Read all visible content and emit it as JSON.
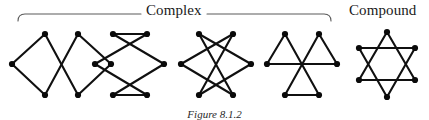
{
  "figure": {
    "caption": "Figure 8.1.2",
    "background_color": "#ffffff",
    "edge_color": "#101010",
    "vertex_color": "#0a0a0a",
    "brace_color": "#5a5a5a",
    "group_labels": {
      "complex": "Complex",
      "compound": "Compound"
    },
    "brace": {
      "name": "complex-group-brace",
      "x_start": 18,
      "x_end": 331,
      "y": 14,
      "gap_start": 141,
      "gap_end": 207
    },
    "panels": [
      {
        "id": "panel-1",
        "name": "complex-hexagram-1",
        "group": "complex",
        "vertex_count": 6,
        "edge_count": 6,
        "description": "two overlapping rhombi sharing crossing edges",
        "vertices": [
          {
            "id": "v0",
            "x": 45,
            "y": 34
          },
          {
            "id": "v1",
            "x": 12,
            "y": 64
          },
          {
            "id": "v2",
            "x": 45,
            "y": 95
          },
          {
            "id": "v3",
            "x": 78,
            "y": 34
          },
          {
            "id": "v4",
            "x": 78,
            "y": 95
          },
          {
            "id": "v5",
            "x": 111,
            "y": 64
          }
        ],
        "edges": [
          [
            "v0",
            "v1"
          ],
          [
            "v1",
            "v2"
          ],
          [
            "v0",
            "v4"
          ],
          [
            "v2",
            "v3"
          ],
          [
            "v3",
            "v5"
          ],
          [
            "v5",
            "v4"
          ]
        ]
      },
      {
        "id": "panel-2",
        "name": "complex-hexagram-2",
        "group": "complex",
        "vertex_count": 6,
        "edge_count": 6,
        "description": "hourglass crossings with flat top and bottom chords",
        "vertices": [
          {
            "id": "v0",
            "x": 113,
            "y": 34
          },
          {
            "id": "v1",
            "x": 95,
            "y": 64
          },
          {
            "id": "v2",
            "x": 113,
            "y": 95
          },
          {
            "id": "v3",
            "x": 147,
            "y": 34
          },
          {
            "id": "v4",
            "x": 147,
            "y": 95
          },
          {
            "id": "v5",
            "x": 164,
            "y": 64
          }
        ],
        "edges": [
          [
            "v0",
            "v3"
          ],
          [
            "v2",
            "v4"
          ],
          [
            "v0",
            "v5"
          ],
          [
            "v1",
            "v3"
          ],
          [
            "v1",
            "v4"
          ],
          [
            "v2",
            "v5"
          ]
        ]
      },
      {
        "id": "panel-3",
        "name": "complex-hexagram-3",
        "group": "complex",
        "vertex_count": 6,
        "edge_count": 6,
        "description": "fully crossed star with no parallel chords",
        "vertices": [
          {
            "id": "v0",
            "x": 199,
            "y": 34
          },
          {
            "id": "v1",
            "x": 181,
            "y": 64
          },
          {
            "id": "v2",
            "x": 199,
            "y": 95
          },
          {
            "id": "v3",
            "x": 233,
            "y": 34
          },
          {
            "id": "v4",
            "x": 233,
            "y": 95
          },
          {
            "id": "v5",
            "x": 251,
            "y": 64
          }
        ],
        "edges": [
          [
            "v0",
            "v4"
          ],
          [
            "v0",
            "v5"
          ],
          [
            "v1",
            "v3"
          ],
          [
            "v1",
            "v4"
          ],
          [
            "v2",
            "v3"
          ],
          [
            "v2",
            "v5"
          ]
        ]
      },
      {
        "id": "panel-4",
        "name": "complex-hexagram-4",
        "group": "complex",
        "vertex_count": 6,
        "edge_count": 6,
        "description": "three triangles meeting at a single central crossing",
        "vertices": [
          {
            "id": "v0",
            "x": 285,
            "y": 34
          },
          {
            "id": "v1",
            "x": 267,
            "y": 64
          },
          {
            "id": "v2",
            "x": 285,
            "y": 95
          },
          {
            "id": "v3",
            "x": 319,
            "y": 34
          },
          {
            "id": "v4",
            "x": 319,
            "y": 95
          },
          {
            "id": "v5",
            "x": 337,
            "y": 64
          }
        ],
        "edges": [
          [
            "v0",
            "v1"
          ],
          [
            "v0",
            "v4"
          ],
          [
            "v1",
            "v5"
          ],
          [
            "v2",
            "v3"
          ],
          [
            "v2",
            "v4"
          ],
          [
            "v3",
            "v5"
          ]
        ]
      },
      {
        "id": "panel-5",
        "name": "compound-hexagram-star-of-david",
        "group": "compound",
        "vertex_count": 6,
        "edge_count": 6,
        "description": "regular hexagram formed by two overlaid equilateral triangles",
        "vertices": [
          {
            "id": "v0",
            "x": 387,
            "y": 32
          },
          {
            "id": "v1",
            "x": 359,
            "y": 48
          },
          {
            "id": "v2",
            "x": 359,
            "y": 80
          },
          {
            "id": "v3",
            "x": 387,
            "y": 97
          },
          {
            "id": "v4",
            "x": 415,
            "y": 80
          },
          {
            "id": "v5",
            "x": 415,
            "y": 48
          }
        ],
        "edges": [
          [
            "v0",
            "v2"
          ],
          [
            "v2",
            "v4"
          ],
          [
            "v4",
            "v0"
          ],
          [
            "v1",
            "v3"
          ],
          [
            "v3",
            "v5"
          ],
          [
            "v5",
            "v1"
          ]
        ]
      }
    ]
  }
}
